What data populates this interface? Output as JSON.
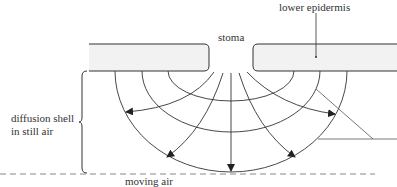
{
  "diagram": {
    "labels": {
      "stoma": "stoma",
      "lower_epidermis": "lower epidermis",
      "diffusion_shell_line1": "diffusion shell",
      "diffusion_shell_line2": "in still air",
      "moving_air": "moving air"
    },
    "colors": {
      "line": "#333333",
      "epidermis_fill": "#f2f2f2",
      "dashed": "#888888"
    },
    "elements": {
      "epidermis_blocks": 2,
      "concentric_shells": 3,
      "diffusion_arrows": 5
    }
  }
}
